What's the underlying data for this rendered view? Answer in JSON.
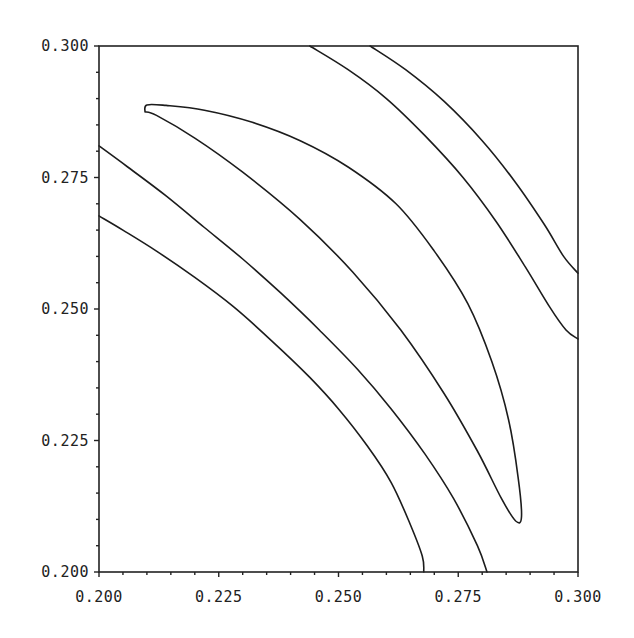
{
  "chart_data": {
    "type": "contour",
    "title": "",
    "xlabel": "",
    "ylabel": "",
    "xlim": [
      0.2,
      0.3
    ],
    "ylim": [
      0.2,
      0.3
    ],
    "grid": false,
    "legend": null,
    "x_ticks": [
      "0.200",
      "0.225",
      "0.250",
      "0.275",
      "0.300"
    ],
    "y_ticks": [
      "0.200",
      "0.225",
      "0.250",
      "0.275",
      "0.300"
    ],
    "x_tick_values": [
      0.2,
      0.225,
      0.25,
      0.275,
      0.3
    ],
    "y_tick_values": [
      0.2,
      0.225,
      0.25,
      0.275,
      0.3
    ],
    "minor_ticks_per_major": 5,
    "series": [
      {
        "name": "contour-1",
        "closed": false,
        "points": [
          [
            0.2,
            0.2677
          ],
          [
            0.205,
            0.265
          ],
          [
            0.212,
            0.261
          ],
          [
            0.22,
            0.256
          ],
          [
            0.228,
            0.2505
          ],
          [
            0.236,
            0.244
          ],
          [
            0.244,
            0.237
          ],
          [
            0.25,
            0.231
          ],
          [
            0.256,
            0.224
          ],
          [
            0.261,
            0.217
          ],
          [
            0.265,
            0.209
          ],
          [
            0.2675,
            0.203
          ],
          [
            0.2678,
            0.2
          ]
        ]
      },
      {
        "name": "contour-2",
        "closed": false,
        "points": [
          [
            0.2,
            0.281
          ],
          [
            0.206,
            0.277
          ],
          [
            0.214,
            0.2715
          ],
          [
            0.222,
            0.2655
          ],
          [
            0.23,
            0.2595
          ],
          [
            0.238,
            0.253
          ],
          [
            0.246,
            0.246
          ],
          [
            0.254,
            0.2385
          ],
          [
            0.261,
            0.231
          ],
          [
            0.268,
            0.2225
          ],
          [
            0.274,
            0.214
          ],
          [
            0.279,
            0.205
          ],
          [
            0.281,
            0.2
          ]
        ]
      },
      {
        "name": "contour-3-closed",
        "closed": true,
        "points": [
          [
            0.2096,
            0.2875
          ],
          [
            0.21,
            0.2888
          ],
          [
            0.214,
            0.2887
          ],
          [
            0.222,
            0.2878
          ],
          [
            0.232,
            0.2855
          ],
          [
            0.242,
            0.282
          ],
          [
            0.252,
            0.277
          ],
          [
            0.262,
            0.27
          ],
          [
            0.27,
            0.261
          ],
          [
            0.277,
            0.251
          ],
          [
            0.282,
            0.24
          ],
          [
            0.2855,
            0.229
          ],
          [
            0.2875,
            0.218
          ],
          [
            0.2882,
            0.2105
          ],
          [
            0.287,
            0.2097
          ],
          [
            0.284,
            0.214
          ],
          [
            0.279,
            0.223
          ],
          [
            0.272,
            0.234
          ],
          [
            0.263,
            0.246
          ],
          [
            0.253,
            0.257
          ],
          [
            0.242,
            0.267
          ],
          [
            0.23,
            0.276
          ],
          [
            0.22,
            0.2825
          ],
          [
            0.212,
            0.2868
          ],
          [
            0.2096,
            0.2875
          ]
        ]
      },
      {
        "name": "contour-4",
        "closed": false,
        "points": [
          [
            0.244,
            0.3
          ],
          [
            0.252,
            0.2955
          ],
          [
            0.26,
            0.29
          ],
          [
            0.268,
            0.283
          ],
          [
            0.276,
            0.275
          ],
          [
            0.283,
            0.2665
          ],
          [
            0.289,
            0.258
          ],
          [
            0.294,
            0.2505
          ],
          [
            0.2975,
            0.246
          ],
          [
            0.3,
            0.2443
          ]
        ]
      },
      {
        "name": "contour-5",
        "closed": false,
        "points": [
          [
            0.2566,
            0.3
          ],
          [
            0.264,
            0.2955
          ],
          [
            0.272,
            0.2895
          ],
          [
            0.28,
            0.282
          ],
          [
            0.287,
            0.274
          ],
          [
            0.293,
            0.266
          ],
          [
            0.297,
            0.26
          ],
          [
            0.3,
            0.2568
          ]
        ]
      }
    ]
  }
}
